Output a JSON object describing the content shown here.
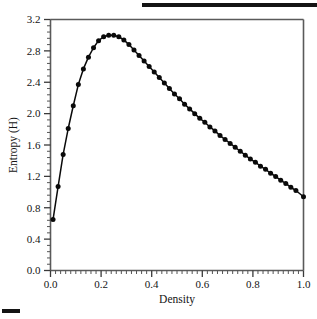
{
  "figure": {
    "top_rule": "decorative-rule",
    "bottom_rule": "decorative-rule"
  },
  "chart_data": {
    "type": "line",
    "title": "",
    "subtitle": "",
    "xlabel": "Density",
    "ylabel": "Entropy (H)",
    "xlim": [
      0.0,
      1.0
    ],
    "ylim": [
      0.0,
      3.2
    ],
    "xticks": [
      0.0,
      0.2,
      0.4,
      0.6,
      0.8,
      1.0
    ],
    "xtick_labels": [
      "0.0",
      "0.2",
      "0.4",
      "0.6",
      "0.8",
      "1.0"
    ],
    "yticks": [
      0.0,
      0.4,
      0.8,
      1.2,
      1.6,
      2.0,
      2.4,
      2.8,
      3.2
    ],
    "ytick_labels": [
      "0.0",
      "0.4",
      "0.8",
      "1.2",
      "1.6",
      "2.0",
      "2.4",
      "2.8",
      "3.2"
    ],
    "x_minor_tick_step": 0.02,
    "y_minor_tick_step": 0.08,
    "grid": false,
    "legend": null,
    "marker": "filled-circle",
    "line_color": "#0a0a0a",
    "marker_color": "#0a0a0a",
    "series": [
      {
        "name": "Entropy",
        "x": [
          0.01,
          0.03,
          0.05,
          0.07,
          0.09,
          0.11,
          0.13,
          0.15,
          0.17,
          0.19,
          0.21,
          0.23,
          0.25,
          0.27,
          0.29,
          0.31,
          0.33,
          0.35,
          0.37,
          0.39,
          0.41,
          0.43,
          0.45,
          0.47,
          0.49,
          0.51,
          0.53,
          0.55,
          0.57,
          0.59,
          0.61,
          0.63,
          0.65,
          0.67,
          0.69,
          0.71,
          0.73,
          0.75,
          0.77,
          0.79,
          0.81,
          0.83,
          0.85,
          0.87,
          0.89,
          0.91,
          0.93,
          0.95,
          0.97,
          1.0
        ],
        "y": [
          0.65,
          1.07,
          1.48,
          1.81,
          2.1,
          2.37,
          2.57,
          2.72,
          2.84,
          2.93,
          2.98,
          3.0,
          3.0,
          2.98,
          2.94,
          2.88,
          2.81,
          2.74,
          2.67,
          2.6,
          2.53,
          2.46,
          2.39,
          2.32,
          2.25,
          2.19,
          2.12,
          2.06,
          2.0,
          1.94,
          1.89,
          1.83,
          1.78,
          1.72,
          1.67,
          1.62,
          1.57,
          1.52,
          1.47,
          1.42,
          1.38,
          1.33,
          1.29,
          1.24,
          1.2,
          1.15,
          1.11,
          1.06,
          1.02,
          0.94
        ]
      }
    ]
  }
}
